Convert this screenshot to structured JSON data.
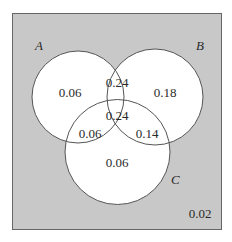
{
  "diagram": {
    "type": "venn-3",
    "colors": {
      "universe": "#c8c8c8",
      "circle_fill": "#ffffff",
      "stroke": "#555555"
    },
    "sets": [
      {
        "name": "A",
        "label": "A"
      },
      {
        "name": "B",
        "label": "B"
      },
      {
        "name": "C",
        "label": "C"
      }
    ],
    "regions": {
      "A_only": "0.06",
      "B_only": "0.18",
      "C_only": "0.06",
      "A_and_B_only": "0.24",
      "A_and_C_only": "0.06",
      "B_and_C_only": "0.14",
      "A_and_B_and_C": "0.24",
      "outside": "0.02"
    }
  }
}
